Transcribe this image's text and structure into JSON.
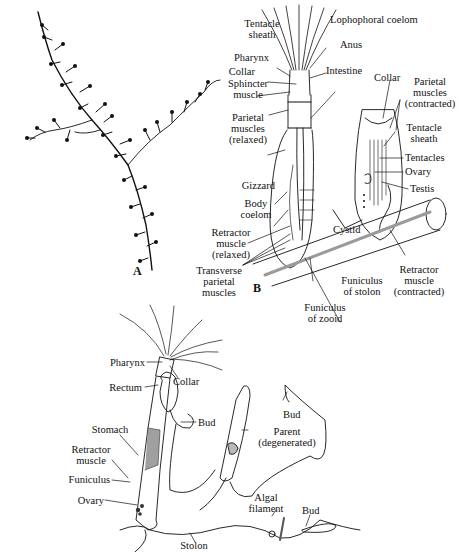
{
  "figure": {
    "panels": [
      {
        "id": "A",
        "label": "A",
        "description": "Colony of branching zooids"
      },
      {
        "id": "B",
        "label": "B",
        "description": "Two zooids: extended (left) and retracted (right) on a stolon"
      },
      {
        "id": "C",
        "label": "",
        "description": "Single zooid with buds on stolon"
      }
    ],
    "panel_b_labels": {
      "lophophoral_coelom": "Lophophoral coelom",
      "tentacle_sheath": "Tentacle sheath",
      "tentacle_sheath_1": "Tentacle",
      "tentacle_sheath_2": "sheath",
      "anus": "Anus",
      "pharynx": "Pharynx",
      "collar_left": "Collar",
      "collar_right": "Collar",
      "intestine": "Intestine",
      "sphincter_1": "Sphincter",
      "sphincter_2": "muscle",
      "parietal_relaxed_1": "Parietal",
      "parietal_relaxed_2": "muscles",
      "parietal_relaxed_3": "(relaxed)",
      "parietal_contracted_1": "Parietal",
      "parietal_contracted_2": "muscles",
      "parietal_contracted_3": "(contracted)",
      "tentacle_sheath_r1": "Tentacle",
      "tentacle_sheath_r2": "sheath",
      "tentacles": "Tentacles",
      "ovary": "Ovary",
      "testis": "Testis",
      "gizzard": "Gizzard",
      "body_coelom_1": "Body",
      "body_coelom_2": "coelom",
      "cystid": "Cystid",
      "retractor_relaxed_1": "Retractor",
      "retractor_relaxed_2": "muscle",
      "retractor_relaxed_3": "(relaxed)",
      "transverse_1": "Transverse",
      "transverse_2": "parietal",
      "transverse_3": "muscles",
      "funiculus_stolon_1": "Funiculus",
      "funiculus_stolon_2": "of stolon",
      "retractor_contracted_1": "Retractor",
      "retractor_contracted_2": "muscle",
      "retractor_contracted_3": "(contracted)",
      "funiculus_zooid_1": "Funiculus",
      "funiculus_zooid_2": "of zooid"
    },
    "panel_c_labels": {
      "pharynx": "Pharynx",
      "collar": "Collar",
      "rectum": "Rectum",
      "stomach": "Stomach",
      "retractor_1": "Retractor",
      "retractor_2": "muscle",
      "funiculus": "Funiculus",
      "ovary": "Ovary",
      "bud_1": "Bud",
      "bud_2": "Bud",
      "bud_3": "Bud",
      "parent_1": "Parent",
      "parent_2": "(degenerated)",
      "algal_1": "Algal",
      "algal_2": "filament",
      "stolon": "Stolon"
    },
    "colors": {
      "ink": "#111111",
      "background": "#ffffff",
      "shade": "#9a9a9a"
    }
  }
}
